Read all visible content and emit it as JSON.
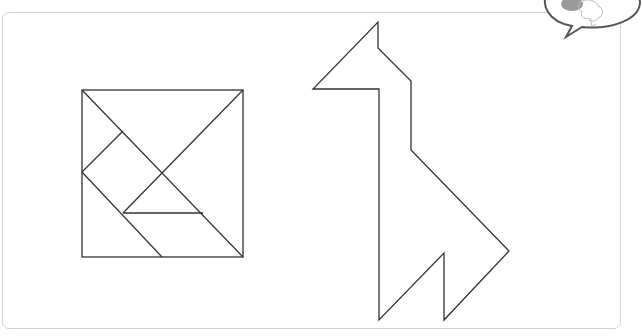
{
  "worksheet": {
    "description": "Tangram worksheet: seven-piece square and giraffe silhouette",
    "colors": {
      "line": "#333333",
      "frame": "#d2d2d2",
      "bubble_outline": "#555555",
      "bubble_fill_gray": "#9a9a9a"
    },
    "tangram_square": {
      "x1": 82,
      "y1": 90,
      "x2": 243,
      "y2": 257,
      "lines": [
        [
          82,
          90,
          243,
          257
        ],
        [
          243,
          90,
          123,
          213
        ],
        [
          82,
          172,
          123,
          131
        ],
        [
          82,
          172,
          162,
          257
        ],
        [
          123,
          213,
          203,
          213
        ]
      ]
    },
    "giraffe": {
      "points": "378,22 378,48 411,81 411,150 509,251 444,320 444,253 379,320 379,89 313,89"
    },
    "speech_bubble": {
      "icon": "brain-icon"
    }
  }
}
